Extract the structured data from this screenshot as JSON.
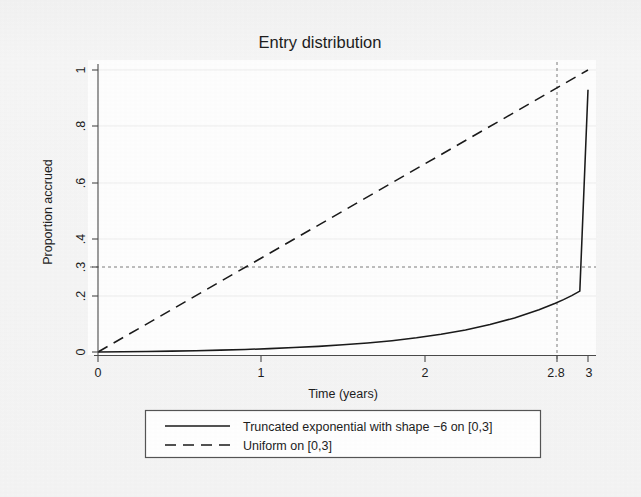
{
  "chart_data": {
    "type": "line",
    "title": "Entry distribution",
    "xlabel": "Time (years)",
    "ylabel": "Proportion accrued",
    "xlim": [
      0,
      3
    ],
    "ylim": [
      0,
      1
    ],
    "grid": true,
    "legend_position": "below",
    "xticks": [
      "0",
      "1",
      "2",
      "2.8",
      "3"
    ],
    "xtick_values": [
      0,
      1,
      2,
      2.8,
      3
    ],
    "yticks": [
      "0",
      ".2",
      ".3",
      ".4",
      ".6",
      ".8",
      "1"
    ],
    "ytick_values": [
      0,
      0.2,
      0.3,
      0.4,
      0.6,
      0.8,
      1
    ],
    "reference_lines": [
      {
        "name": "accrual-target-hline",
        "orientation": "horizontal",
        "value": 0.3,
        "style": "dashed"
      },
      {
        "name": "accrual-time-vline",
        "orientation": "vertical",
        "value": 2.8,
        "style": "dashed"
      }
    ],
    "annotations": [
      {
        "text": "2.8",
        "axis": "x",
        "value": 2.8
      }
    ],
    "series": [
      {
        "name": "Truncated exponential with shape −6 on [0,3]",
        "style": "solid",
        "shape": -6,
        "x": [
          0,
          0.15,
          0.3,
          0.45,
          0.6,
          0.75,
          0.9,
          1.05,
          1.2,
          1.35,
          1.5,
          1.65,
          1.8,
          1.95,
          2.1,
          2.25,
          2.4,
          2.55,
          2.7,
          2.8,
          2.85,
          2.9,
          2.95,
          3
        ],
        "values": [
          0,
          0.0008,
          0.0018,
          0.0031,
          0.0047,
          0.0066,
          0.009,
          0.012,
          0.0156,
          0.02,
          0.0254,
          0.032,
          0.0402,
          0.0503,
          0.0628,
          0.0782,
          0.0972,
          0.1207,
          0.1497,
          0.1726,
          0.1856,
          0.2,
          0.2158,
          0.93
        ]
      },
      {
        "name": "Uniform on [0,3]",
        "style": "dashed",
        "x": [
          0,
          3
        ],
        "values": [
          0,
          1
        ]
      }
    ],
    "legend": [
      {
        "label": "Truncated exponential with shape −6 on [0,3]",
        "style": "solid"
      },
      {
        "label": "Uniform on [0,3]",
        "style": "dashed"
      }
    ]
  }
}
